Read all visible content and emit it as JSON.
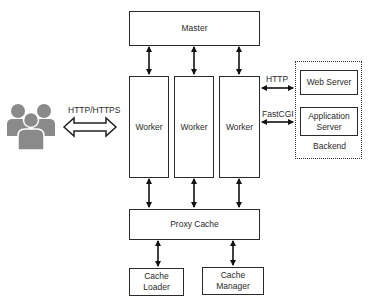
{
  "diagram": {
    "clients": {
      "icon": "users-group-icon",
      "protocol_label": "HTTP/HTTPS"
    },
    "master": {
      "label": "Master"
    },
    "workers": [
      {
        "label": "Worker"
      },
      {
        "label": "Worker"
      },
      {
        "label": "Worker"
      }
    ],
    "proxy_cache": {
      "label": "Proxy Cache"
    },
    "cache_loader": {
      "label": "Cache\nLoader",
      "line1": "Cache",
      "line2": "Loader"
    },
    "cache_manager": {
      "label": "Cache\nManager",
      "line1": "Cache",
      "line2": "Manager"
    },
    "backend": {
      "label": "Backend",
      "web_server": {
        "label": "Web Server"
      },
      "application_server": {
        "line1": "Application",
        "line2": "Server"
      },
      "links": [
        {
          "protocol": "HTTP",
          "target": "Web Server"
        },
        {
          "protocol": "FastCGI",
          "target": "Application Server"
        }
      ]
    },
    "edges": [
      {
        "from": "Master",
        "to": "Worker 1",
        "bidirectional": true
      },
      {
        "from": "Master",
        "to": "Worker 2",
        "bidirectional": true
      },
      {
        "from": "Master",
        "to": "Worker 3",
        "bidirectional": true
      },
      {
        "from": "Worker 1",
        "to": "Proxy Cache",
        "bidirectional": true
      },
      {
        "from": "Worker 2",
        "to": "Proxy Cache",
        "bidirectional": true
      },
      {
        "from": "Worker 3",
        "to": "Proxy Cache",
        "bidirectional": true
      },
      {
        "from": "Proxy Cache",
        "to": "Cache Loader",
        "bidirectional": true
      },
      {
        "from": "Proxy Cache",
        "to": "Cache Manager",
        "bidirectional": true
      },
      {
        "from": "Clients",
        "to": "Worker 1",
        "bidirectional": true,
        "label": "HTTP/HTTPS"
      },
      {
        "from": "Worker 3",
        "to": "Web Server",
        "bidirectional": true,
        "label": "HTTP"
      },
      {
        "from": "Worker 3",
        "to": "Application Server",
        "bidirectional": true,
        "label": "FastCGI"
      }
    ]
  }
}
